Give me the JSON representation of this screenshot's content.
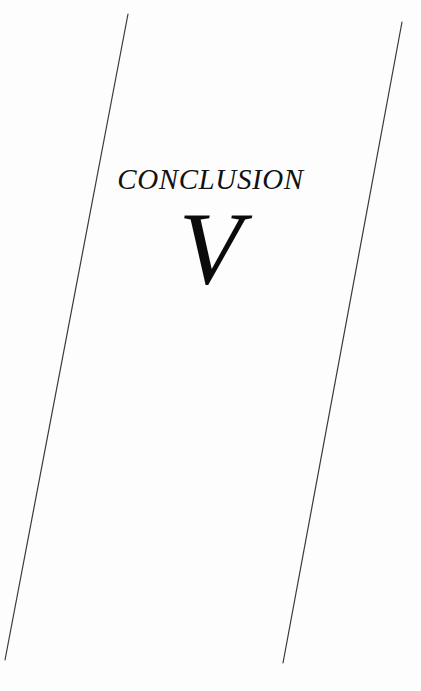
{
  "page": {
    "background_color": "#fdfdfd",
    "width": 421,
    "height": 691
  },
  "heading": {
    "section_label": "CONCLUSION",
    "section_numeral": "V",
    "text_color": "#111111"
  },
  "decoration": {
    "rule_color": "#3a3a3a",
    "rule_width": 1.2,
    "left_rule": {
      "name": "left-diagonal-rule",
      "x1": 128,
      "y1": 14,
      "x2": 5,
      "y2": 660
    },
    "right_rule": {
      "name": "right-diagonal-rule",
      "x1": 402,
      "y1": 22,
      "x2": 283,
      "y2": 663
    }
  }
}
